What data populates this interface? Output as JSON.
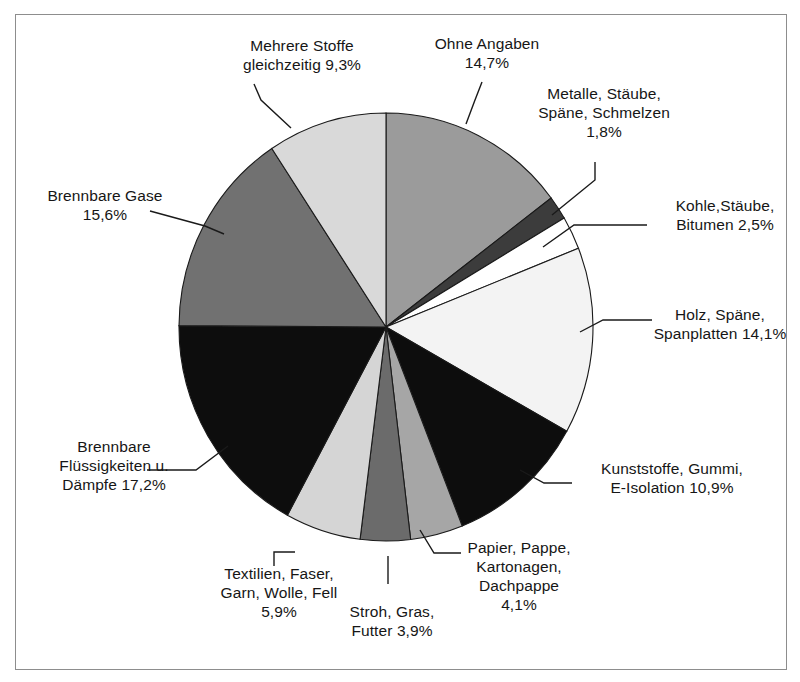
{
  "figure": {
    "background_color": "#ffffff",
    "frame_color": "#8d8d8d",
    "slice_outline_color": "#1a1a1a"
  },
  "chart_data": {
    "type": "pie",
    "title": "",
    "xlabel": "",
    "ylabel": "",
    "start_angle_deg": 0,
    "direction": "clockwise",
    "legend_position": "none",
    "grid": false,
    "units": "%",
    "decimal_separator": ",",
    "categories": [
      "Ohne Angaben",
      "Metalle, Stäube, Späne, Schmelzen",
      "Kohle,Stäube, Bitumen",
      "Holz, Späne, Spanplatten",
      "Kunststoffe, Gummi, E-Isolation",
      "Papier, Pappe, Kartonagen, Dachpappe",
      "Stroh, Gras, Futter",
      "Textilien, Faser, Garn, Wolle, Fell",
      "Brennbare Flüssigkeiten u. Dämpfe",
      "Brennbare Gase",
      "Mehrere Stoffe gleichzeitig"
    ],
    "values": [
      14.7,
      1.8,
      2.5,
      14.1,
      10.9,
      4.1,
      3.9,
      5.9,
      17.2,
      15.6,
      9.3
    ],
    "colors": [
      "#9b9b9b",
      "#3c3c3c",
      "#ffffff",
      "#f3f3f3",
      "#0d0d0d",
      "#a6a6a6",
      "#6b6b6b",
      "#d5d5d5",
      "#0d0d0d",
      "#717171",
      "#d9d9d9"
    ]
  },
  "labels": [
    {
      "name": "mehrere-stoffe",
      "lines": [
        "Mehrere Stoffe",
        "gleichzeitig 9,3%"
      ],
      "value": "9,3%"
    },
    {
      "name": "ohne-angaben",
      "lines": [
        "Ohne Angaben",
        "14,7%"
      ],
      "value": "14,7%"
    },
    {
      "name": "metalle",
      "lines": [
        "Metalle, Stäube,",
        "Späne, Schmelzen",
        "1,8%"
      ],
      "value": "1,8%"
    },
    {
      "name": "kohle",
      "lines": [
        "Kohle,Stäube,",
        "Bitumen 2,5%"
      ],
      "value": "2,5%"
    },
    {
      "name": "holz",
      "lines": [
        "Holz, Späne,",
        "Spanplatten 14,1%"
      ],
      "value": "14,1%"
    },
    {
      "name": "kunststoffe",
      "lines": [
        "Kunststoffe, Gummi,",
        "E-Isolation 10,9%"
      ],
      "value": "10,9%"
    },
    {
      "name": "papier",
      "lines": [
        "Papier, Pappe,",
        "Kartonagen,",
        "Dachpappe",
        "4,1%"
      ],
      "value": "4,1%"
    },
    {
      "name": "stroh",
      "lines": [
        "Stroh, Gras,",
        "Futter 3,9%"
      ],
      "value": "3,9%"
    },
    {
      "name": "textilien",
      "lines": [
        "Textilien, Faser,",
        "Garn, Wolle, Fell",
        "5,9%"
      ],
      "value": "5,9%"
    },
    {
      "name": "brennbare-fluessigkeiten",
      "lines": [
        "Brennbare",
        "Flüssigkeiten u.",
        "Dämpfe 17,2%"
      ],
      "value": "17,2%"
    },
    {
      "name": "brennbare-gase",
      "lines": [
        "Brennbare Gase",
        "15,6%"
      ],
      "value": "15,6%"
    }
  ]
}
